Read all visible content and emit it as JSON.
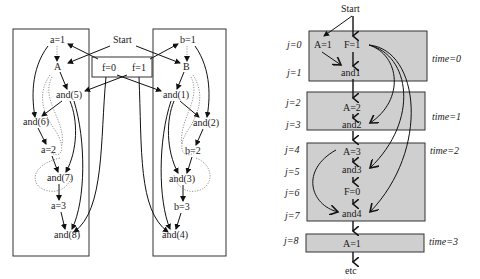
{
  "left_diagram": {
    "start_label": "Start",
    "flag_box": {
      "f0": "f=0",
      "f1": "f=1"
    },
    "left_column": {
      "nodes": [
        "a=1",
        "A",
        "and(5)",
        "and(6)",
        "a=2",
        "and(7)",
        "a=3",
        "and(8)"
      ]
    },
    "right_column": {
      "nodes": [
        "b=1",
        "B",
        "and(1)",
        "and(2)",
        "b=2",
        "and(3)",
        "b=3",
        "and(4)"
      ]
    }
  },
  "right_diagram": {
    "start_label": "Start",
    "end_label": "etc",
    "j_labels": [
      "j=0",
      "j=1",
      "j=2",
      "j=3",
      "j=4",
      "j=5",
      "j=6",
      "j=7",
      "j=8"
    ],
    "time_labels": [
      "time=0",
      "time=1",
      "time=2",
      "time=3"
    ],
    "blocks": [
      {
        "nodes": [
          "A=1",
          "F=1",
          "and1"
        ]
      },
      {
        "nodes": [
          "A=2",
          "and2"
        ]
      },
      {
        "nodes": [
          "A=3",
          "and3",
          "F=0",
          "and4"
        ]
      },
      {
        "nodes": [
          "A=1"
        ]
      }
    ]
  }
}
